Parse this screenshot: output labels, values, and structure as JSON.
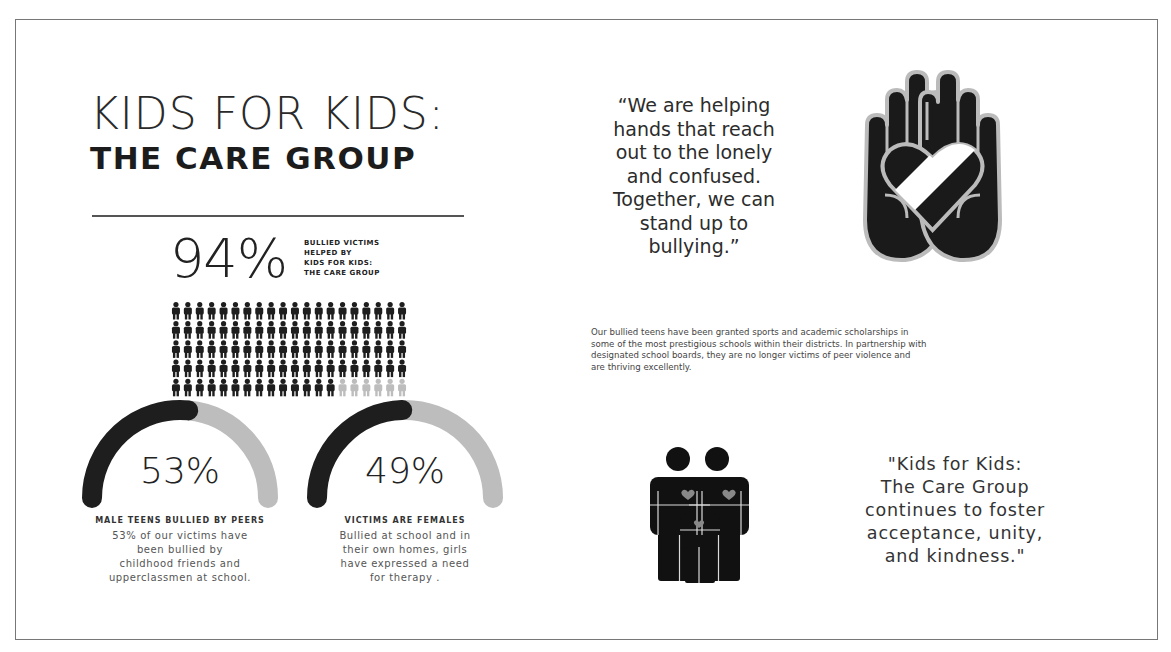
{
  "header": {
    "title_line1": "KIDS FOR KIDS:",
    "title_line2": "THE CARE GROUP"
  },
  "headline_stat": {
    "value": "94%",
    "caption_lines": [
      "BULLIED VICTIMS",
      "HELPED BY",
      "KIDS FOR KIDS:",
      "THE CARE GROUP"
    ],
    "pictogram": {
      "total": 100,
      "highlighted": 94,
      "columns": 20,
      "rows": 5,
      "icon": "person-icon"
    }
  },
  "gauges": [
    {
      "value": "53%",
      "fraction": 0.53,
      "title": "MALE TEENS BULLIED BY PEERS",
      "body_lines": [
        "53% of our victims have",
        "been bullied by",
        "childhood friends and",
        "upperclassmen at school."
      ]
    },
    {
      "value": "49%",
      "fraction": 0.49,
      "title": "VICTIMS ARE FEMALES",
      "body_lines": [
        "Bullied at school and in",
        "their own homes, girls",
        "have expressed a need",
        "for therapy ."
      ]
    }
  ],
  "quote_top": {
    "lines": [
      "“We are helping",
      "hands that reach",
      "out to the lonely",
      "and confused.",
      "Together, we can",
      "stand up to",
      "bullying.”"
    ],
    "icon": "hands-heart-icon"
  },
  "paragraph": {
    "lines": [
      "Our bullied teens have been granted sports and academic scholarships in",
      "some of the most prestigious schools within their districts. In partnership with",
      "designated school boards, they are no longer victims of peer violence and",
      "are thriving excellently."
    ]
  },
  "quote_bottom": {
    "lines": [
      "\"Kids for Kids:",
      "The Care Group",
      "continues to foster",
      "acceptance, unity,",
      "and kindness.\""
    ],
    "icon": "family-icon"
  },
  "colors": {
    "dark": "#1e1e1e",
    "light": "#bdbdbd",
    "frame": "#777777",
    "text": "#222222"
  }
}
